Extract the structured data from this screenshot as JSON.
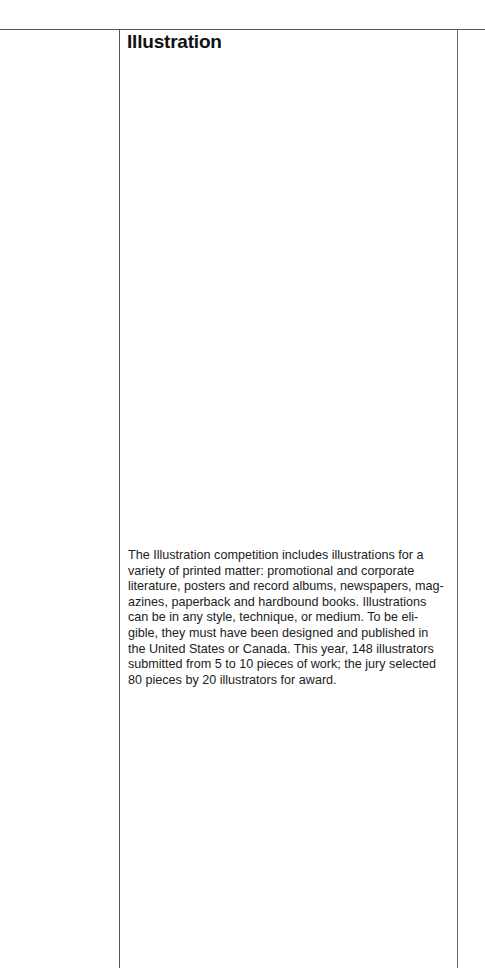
{
  "page": {
    "title": "Illustration",
    "body_lines": "The Illustration competition includes illustrations for a\nvariety of printed matter: promotional and corporate\nliterature, posters and record albums, newspapers, mag-\nazines, paperback and hardbound books. Illustrations\ncan be in any style, technique, or medium. To be eli-\ngible, they must have been designed and published in\nthe United States or Canada. This year, 148 illustrators\nsubmitted from 5 to 10 pieces of work; the jury selected\n80 pieces by 20 illustrators for award."
  }
}
